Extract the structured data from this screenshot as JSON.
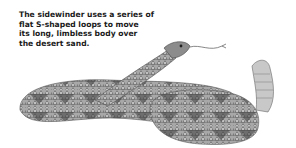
{
  "caption": {
    "lines": [
      "The sidewinder uses a series of",
      "flat S-shaped loops to move",
      "its long, limbless body over",
      "the desert sand."
    ]
  },
  "illustration": {
    "subject": "sidewinder rattlesnake, coiled",
    "colors": {
      "scale_dark": "#3a3a3a",
      "scale_mid": "#8a8a8a",
      "scale_light": "#d6d6d6"
    }
  }
}
